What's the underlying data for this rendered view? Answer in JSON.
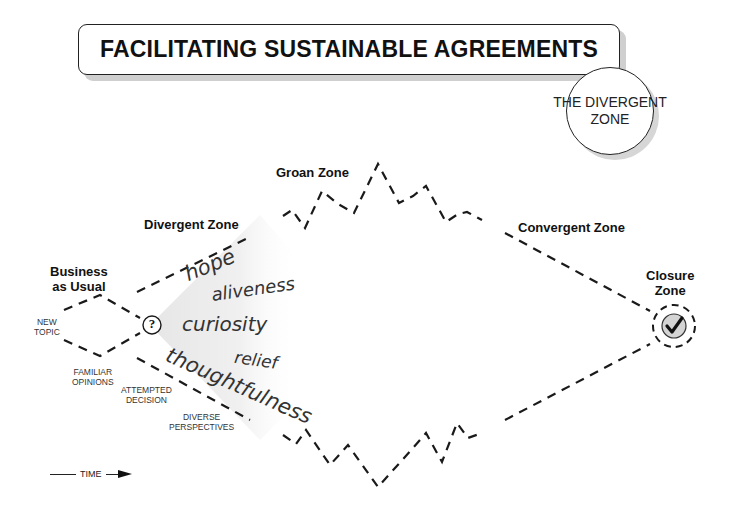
{
  "title": "FACILITATING SUSTAINABLE AGREEMENTS",
  "badge": {
    "line1": "THE DIVERGENT",
    "line2": "ZONE"
  },
  "zones": {
    "business_as_usual": {
      "line1": "Business",
      "line2": "as Usual"
    },
    "divergent": "Divergent Zone",
    "groan": "Groan Zone",
    "convergent": "Convergent Zone",
    "closure": {
      "line1": "Closure",
      "line2": "Zone"
    }
  },
  "small_labels": {
    "new_topic": {
      "line1": "NEW",
      "line2": "TOPIC"
    },
    "familiar_opinions": {
      "line1": "FAMILIAR",
      "line2": "OPINIONS"
    },
    "attempted_decision": {
      "line1": "ATTEMPTED",
      "line2": "DECISION"
    },
    "diverse_perspectives": {
      "line1": "DIVERSE",
      "line2": "PERSPECTIVES"
    }
  },
  "feelings": [
    "hope",
    "aliveness",
    "curiosity",
    "relief",
    "thoughtfulness"
  ],
  "question_symbol": "?",
  "check_symbol": "✔",
  "time_label": "TIME",
  "colors": {
    "line": "#1a1a1a",
    "fan": "#ececec",
    "closure_fill": "#d4d4d4",
    "shadow": "#cfcfcf"
  }
}
